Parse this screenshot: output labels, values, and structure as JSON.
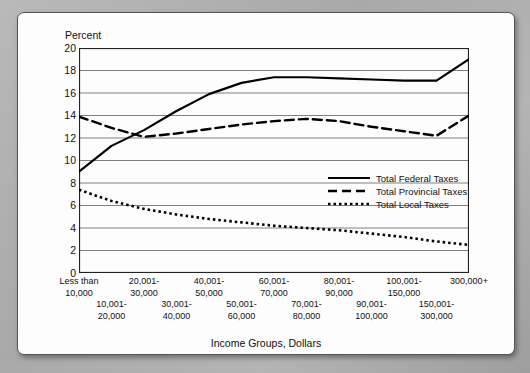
{
  "chart_data": {
    "type": "line",
    "title": "",
    "ylabel": "Percent",
    "xlabel": "Income Groups, Dollars",
    "ylim": [
      0,
      20
    ],
    "yticks": [
      0,
      2,
      4,
      6,
      8,
      10,
      12,
      14,
      16,
      18,
      20
    ],
    "grid": true,
    "legend_position": "inside-right",
    "categories": [
      "Less than 10,000",
      "10,001-20,000",
      "20,001-30,000",
      "30,001-40,000",
      "40,001-50,000",
      "50,001-60,000",
      "60,001-70,000",
      "70,001-80,000",
      "80,001-90,000",
      "90,001-100,000",
      "100,001-150,000",
      "150,001-300,000",
      "300,000+"
    ],
    "x_tick_labels_upper": [
      "Less than\n10,000",
      "20,001-\n30,000",
      "40,001-\n50,000",
      "60,001-\n70,000",
      "80,001-\n90,000",
      "100,001-\n150,000",
      "300,000+"
    ],
    "x_tick_labels_lower": [
      "10,001-\n20,000",
      "30,001-\n40,000",
      "50,001-\n60,000",
      "70,001-\n80,000",
      "90,001-\n100,000",
      "150,001-\n300,000"
    ],
    "series": [
      {
        "name": "Total Federal Taxes",
        "style": "solid",
        "values": [
          9.0,
          11.3,
          12.7,
          14.4,
          15.9,
          16.9,
          17.4,
          17.4,
          17.3,
          17.2,
          17.1,
          17.1,
          19.0
        ]
      },
      {
        "name": "Total Provincial Taxes",
        "style": "dashed",
        "values": [
          13.9,
          12.9,
          12.1,
          12.4,
          12.8,
          13.2,
          13.5,
          13.7,
          13.5,
          13.0,
          12.6,
          12.2,
          14.0
        ]
      },
      {
        "name": "Total Local Taxes",
        "style": "dotted",
        "values": [
          7.4,
          6.4,
          5.7,
          5.2,
          4.8,
          4.5,
          4.2,
          4.0,
          3.8,
          3.5,
          3.2,
          2.8,
          2.5
        ]
      }
    ]
  },
  "axis": {
    "y_title": "Percent",
    "x_title": "Income Groups, Dollars",
    "y_tick_0": "0",
    "y_tick_1": "2",
    "y_tick_2": "4",
    "y_tick_3": "6",
    "y_tick_4": "8",
    "y_tick_5": "10",
    "y_tick_6": "12",
    "y_tick_7": "14",
    "y_tick_8": "16",
    "y_tick_9": "18",
    "y_tick_10": "20"
  },
  "xlabels": {
    "upper": [
      {
        "l1": "Less than",
        "l2": "10,000"
      },
      {
        "l1": "20,001-",
        "l2": "30,000"
      },
      {
        "l1": "40,001-",
        "l2": "50,000"
      },
      {
        "l1": "60,001-",
        "l2": "70,000"
      },
      {
        "l1": "80,001-",
        "l2": "90,000"
      },
      {
        "l1": "100,001-",
        "l2": "150,000"
      },
      {
        "l1": "300,000+",
        "l2": ""
      }
    ],
    "lower": [
      {
        "l1": "10,001-",
        "l2": "20,000"
      },
      {
        "l1": "30,001-",
        "l2": "40,000"
      },
      {
        "l1": "50,001-",
        "l2": "60,000"
      },
      {
        "l1": "70,001-",
        "l2": "80,000"
      },
      {
        "l1": "90,001-",
        "l2": "100,000"
      },
      {
        "l1": "150,001-",
        "l2": "300,000"
      }
    ]
  },
  "legend": {
    "items": [
      {
        "label": "Total Federal Taxes",
        "style": "solid"
      },
      {
        "label": "Total Provincial Taxes",
        "style": "dashed"
      },
      {
        "label": "Total Local Taxes",
        "style": "dotted"
      }
    ]
  },
  "colors": {
    "line": "#000000",
    "grid": "#808080",
    "frame": "#222222",
    "card": "#fdfdfd"
  }
}
